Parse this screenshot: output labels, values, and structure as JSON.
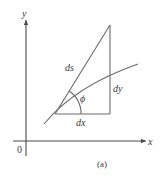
{
  "figure": {
    "caption": "(a)",
    "axes": {
      "x_label": "x",
      "y_label": "y",
      "origin_label": "0"
    },
    "labels": {
      "hypotenuse": "ds",
      "vertical_leg": "dy",
      "horizontal_leg": "dx",
      "angle": "ϕ"
    },
    "colors": {
      "lines": "#6b6b6b",
      "axes": "#4a4a4a",
      "text": "#3a3a3a",
      "background": "#ffffff"
    }
  }
}
